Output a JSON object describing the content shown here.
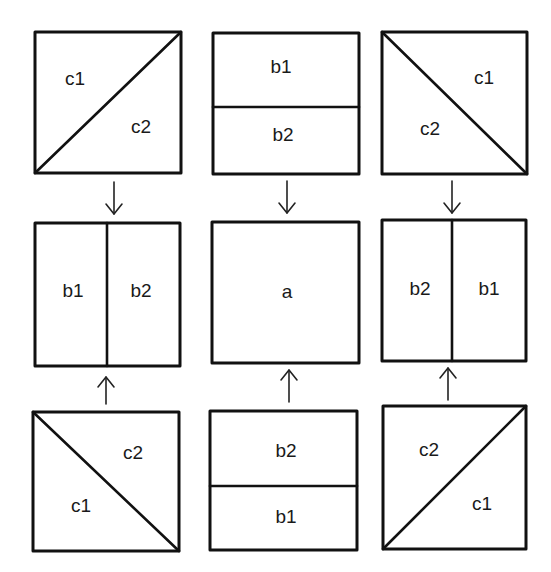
{
  "diagram": {
    "colors": {
      "stroke": "#111111",
      "text": "#1a1a1a",
      "background": "#ffffff"
    },
    "panels": [
      {
        "id": "top-left",
        "x": 35,
        "y": 32,
        "w": 146,
        "h": 141,
        "split": "diagonal-up",
        "labels": [
          {
            "text": "c1",
            "x": 75,
            "y": 78
          },
          {
            "text": "c2",
            "x": 141,
            "y": 126
          }
        ]
      },
      {
        "id": "top-center",
        "x": 213,
        "y": 33,
        "w": 146,
        "h": 141,
        "split": "horizontal",
        "divider": 107,
        "labels": [
          {
            "text": "b1",
            "x": 281,
            "y": 66
          },
          {
            "text": "b2",
            "x": 283,
            "y": 134
          }
        ]
      },
      {
        "id": "top-right",
        "x": 382,
        "y": 32,
        "w": 145,
        "h": 142,
        "split": "diagonal-down",
        "labels": [
          {
            "text": "c1",
            "x": 484,
            "y": 77
          },
          {
            "text": "c2",
            "x": 430,
            "y": 128
          }
        ]
      },
      {
        "id": "middle-left",
        "x": 35,
        "y": 223,
        "w": 145,
        "h": 143,
        "split": "vertical",
        "divider": 107,
        "labels": [
          {
            "text": "b1",
            "x": 73,
            "y": 290
          },
          {
            "text": "b2",
            "x": 141,
            "y": 290
          }
        ]
      },
      {
        "id": "middle-center",
        "x": 212,
        "y": 222,
        "w": 147,
        "h": 141,
        "split": "none",
        "labels": [
          {
            "text": "a",
            "x": 287,
            "y": 291
          }
        ]
      },
      {
        "id": "middle-right",
        "x": 382,
        "y": 220,
        "w": 144,
        "h": 141,
        "split": "vertical",
        "divider": 452,
        "labels": [
          {
            "text": "b2",
            "x": 420,
            "y": 288
          },
          {
            "text": "b1",
            "x": 489,
            "y": 288
          }
        ]
      },
      {
        "id": "bottom-left",
        "x": 33,
        "y": 412,
        "w": 146,
        "h": 139,
        "split": "diagonal-down",
        "labels": [
          {
            "text": "c2",
            "x": 133,
            "y": 452
          },
          {
            "text": "c1",
            "x": 81,
            "y": 505
          }
        ]
      },
      {
        "id": "bottom-center",
        "x": 210,
        "y": 411,
        "w": 147,
        "h": 139,
        "split": "horizontal",
        "divider": 486,
        "labels": [
          {
            "text": "b2",
            "x": 286,
            "y": 450
          },
          {
            "text": "b1",
            "x": 286,
            "y": 516
          }
        ]
      },
      {
        "id": "bottom-right",
        "x": 383,
        "y": 406,
        "w": 143,
        "h": 143,
        "split": "diagonal-up",
        "labels": [
          {
            "text": "c2",
            "x": 429,
            "y": 449
          },
          {
            "text": "c1",
            "x": 482,
            "y": 503
          }
        ]
      }
    ],
    "arrows": [
      {
        "id": "arrow-top-left",
        "direction": "down",
        "x": 114,
        "y1": 182,
        "y2": 214
      },
      {
        "id": "arrow-top-center",
        "direction": "down",
        "x": 287,
        "y1": 181,
        "y2": 213
      },
      {
        "id": "arrow-top-right",
        "direction": "down",
        "x": 452,
        "y1": 181,
        "y2": 213
      },
      {
        "id": "arrow-bottom-left",
        "direction": "up",
        "x": 106,
        "y1": 404,
        "y2": 377
      },
      {
        "id": "arrow-bottom-center",
        "direction": "up",
        "x": 289,
        "y1": 402,
        "y2": 370
      },
      {
        "id": "arrow-bottom-right",
        "direction": "up",
        "x": 448,
        "y1": 400,
        "y2": 368
      }
    ]
  }
}
